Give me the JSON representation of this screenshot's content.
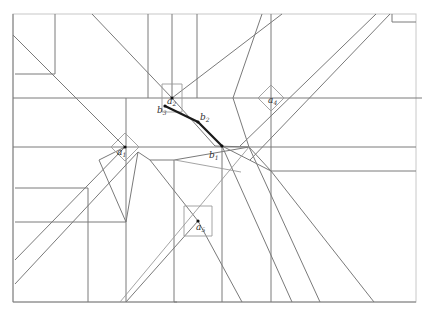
{
  "diagram": {
    "type": "crease-pattern",
    "width": 426,
    "height": 314,
    "colors": {
      "line": "#7a7a7a",
      "highlight_path": "#1a1a1a",
      "background": "#ffffff"
    },
    "labels": [
      {
        "id": "a1",
        "base": "a",
        "sub": "1",
        "x": 117,
        "y": 155
      },
      {
        "id": "a2",
        "base": "a",
        "sub": "2",
        "x": 167,
        "y": 104
      },
      {
        "id": "a4",
        "base": "a",
        "sub": "4",
        "x": 268,
        "y": 103
      },
      {
        "id": "a5",
        "base": "a",
        "sub": "5",
        "x": 196,
        "y": 230
      },
      {
        "id": "b1",
        "base": "b",
        "sub": "1",
        "x": 209,
        "y": 158
      },
      {
        "id": "b2",
        "base": "b",
        "sub": "2",
        "x": 200,
        "y": 120
      },
      {
        "id": "b3",
        "base": "b",
        "sub": "3",
        "x": 157,
        "y": 113
      }
    ],
    "points": [
      {
        "id": "a1",
        "x": 125,
        "y": 147
      },
      {
        "id": "a2",
        "x": 172,
        "y": 98
      },
      {
        "id": "a5",
        "x": 198,
        "y": 221
      },
      {
        "id": "b1",
        "x": 222,
        "y": 146
      },
      {
        "id": "b2",
        "x": 198,
        "y": 122
      },
      {
        "id": "b3",
        "x": 165,
        "y": 106
      }
    ],
    "highlight_path": [
      [
        165,
        106
      ],
      [
        198,
        122
      ],
      [
        222,
        146
      ]
    ],
    "lines": [
      [
        13,
        14,
        13,
        302
      ],
      [
        13,
        302,
        416,
        302
      ],
      [
        13,
        98,
        422,
        98
      ],
      [
        13,
        147,
        249,
        147
      ],
      [
        249,
        147,
        416,
        147
      ],
      [
        15,
        74,
        55,
        74
      ],
      [
        55,
        14,
        55,
        74
      ],
      [
        15,
        188,
        88,
        188
      ],
      [
        88,
        188,
        88,
        302
      ],
      [
        15,
        222,
        126,
        222
      ],
      [
        126,
        98,
        126,
        222
      ],
      [
        126,
        222,
        126,
        302
      ],
      [
        148,
        14,
        148,
        98
      ],
      [
        172,
        14,
        172,
        98
      ],
      [
        197,
        14,
        197,
        98
      ],
      [
        174,
        160,
        174,
        302
      ],
      [
        222,
        146,
        222,
        302
      ],
      [
        271,
        14,
        271,
        98
      ],
      [
        271,
        98,
        271,
        147
      ],
      [
        271,
        147,
        271,
        302
      ],
      [
        271,
        171,
        416,
        171
      ],
      [
        177,
        302,
        174,
        302
      ],
      [
        13,
        35,
        125,
        147
      ],
      [
        92,
        14,
        172,
        98
      ],
      [
        172,
        98,
        282,
        14
      ],
      [
        125,
        147,
        15,
        260
      ],
      [
        138,
        152,
        15,
        284
      ],
      [
        125,
        147,
        99,
        160
      ],
      [
        99,
        160,
        126,
        222
      ],
      [
        126,
        222,
        138,
        152
      ],
      [
        172,
        98,
        215,
        146
      ],
      [
        215,
        146,
        249,
        147
      ],
      [
        249,
        147,
        320,
        302
      ],
      [
        222,
        146,
        292,
        302
      ],
      [
        249,
        147,
        233,
        98
      ],
      [
        233,
        98,
        262,
        14
      ],
      [
        249,
        147,
        271,
        171
      ],
      [
        271,
        171,
        374,
        302
      ],
      [
        174,
        160,
        249,
        147
      ],
      [
        150,
        160,
        174,
        160
      ],
      [
        138,
        152,
        150,
        160
      ],
      [
        150,
        160,
        198,
        221
      ],
      [
        198,
        221,
        242,
        302
      ],
      [
        198,
        221,
        126,
        302
      ],
      [
        222,
        146,
        271,
        171
      ],
      [
        240,
        146,
        376,
        14
      ],
      [
        250,
        160,
        390,
        14
      ],
      [
        392,
        14,
        392,
        22
      ],
      [
        392,
        22,
        416,
        22
      ]
    ],
    "thin_lines": [
      [
        120,
        302,
        249,
        147
      ],
      [
        241,
        172,
        175,
        160
      ],
      [
        162,
        84,
        182,
        84
      ],
      [
        162,
        84,
        162,
        112
      ],
      [
        162,
        112,
        182,
        112
      ],
      [
        182,
        84,
        182,
        112
      ],
      [
        184,
        206,
        212,
        206
      ],
      [
        184,
        206,
        184,
        236
      ],
      [
        184,
        236,
        212,
        236
      ],
      [
        212,
        206,
        212,
        236
      ],
      [
        111,
        147,
        125,
        133
      ],
      [
        125,
        133,
        139,
        147
      ],
      [
        139,
        147,
        125,
        161
      ],
      [
        125,
        161,
        111,
        147
      ],
      [
        258,
        98,
        271,
        85
      ],
      [
        271,
        85,
        284,
        98
      ],
      [
        284,
        98,
        271,
        111
      ],
      [
        271,
        111,
        258,
        98
      ]
    ],
    "frame": {
      "left": 13,
      "top": 14,
      "right": 416,
      "bottom": 302
    }
  }
}
